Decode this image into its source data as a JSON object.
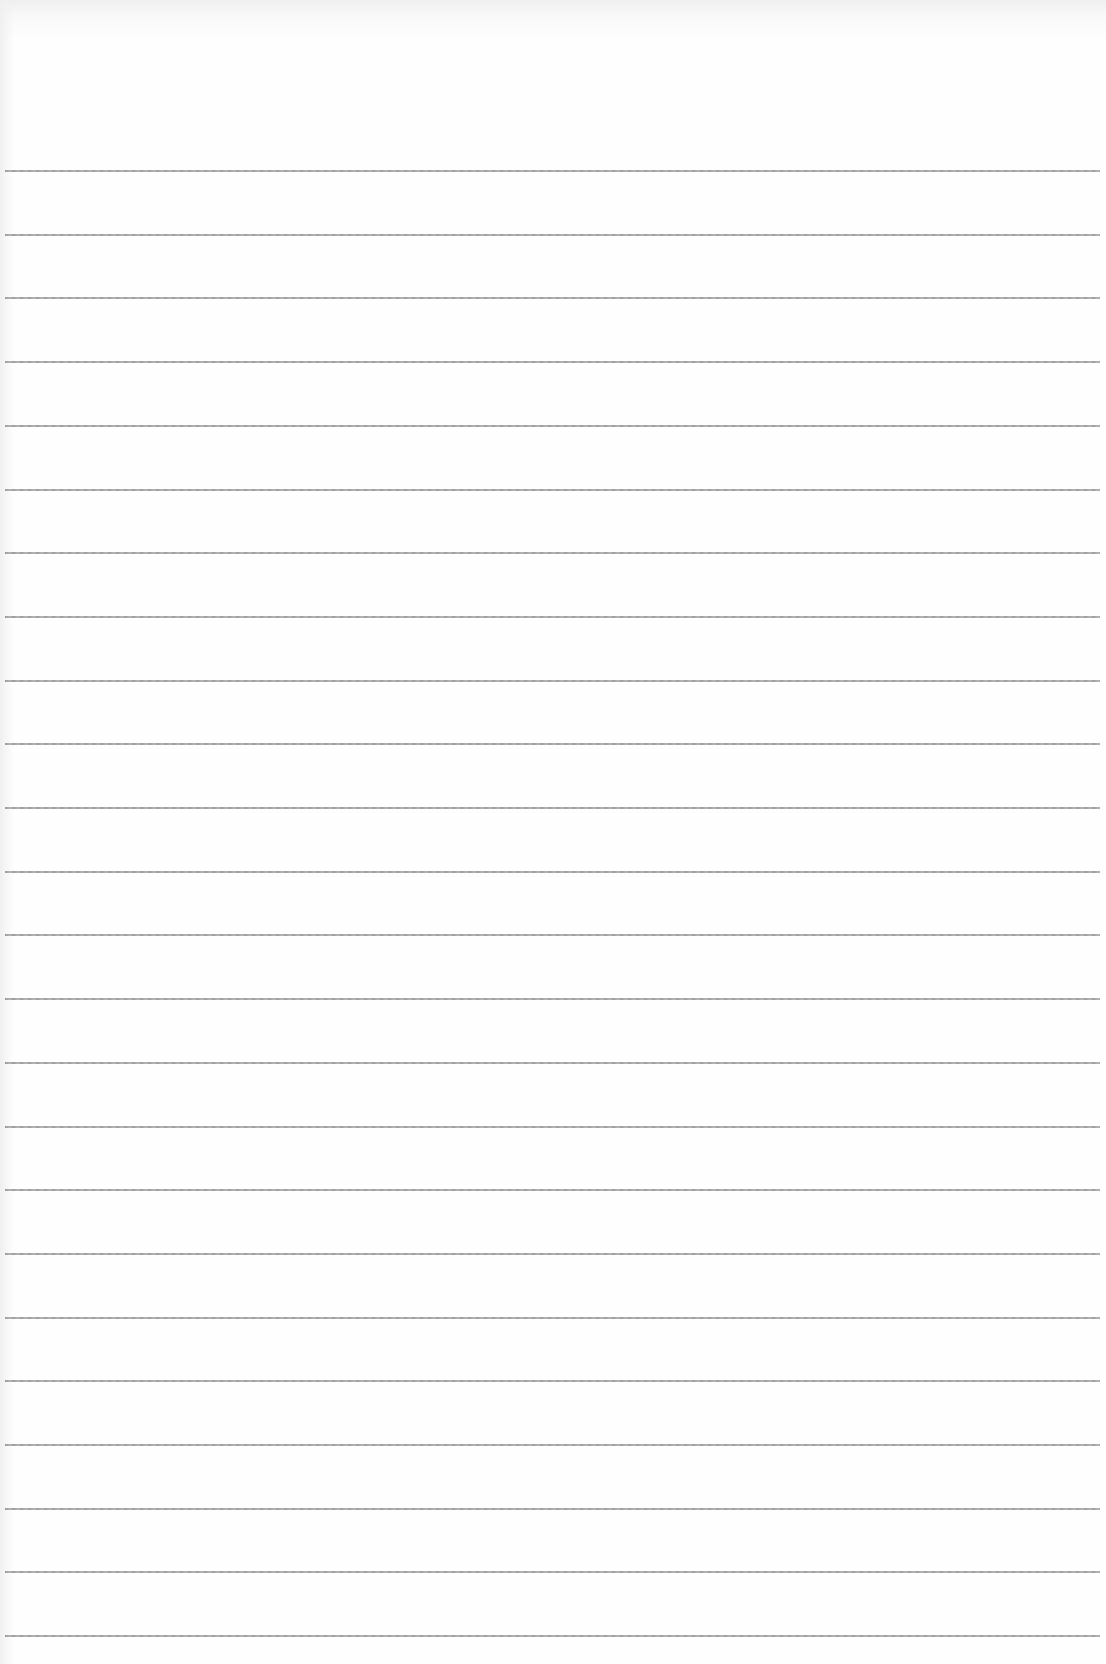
{
  "document": {
    "type": "lined paper",
    "background_color": "#fefefe",
    "line_color": "#959595",
    "rule_count": 24,
    "first_rule_y": 170,
    "rule_spacing": 63.7,
    "rule_left": 5,
    "rule_width": 1095
  }
}
